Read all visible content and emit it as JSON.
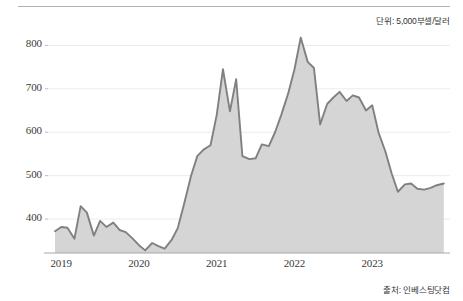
{
  "annotations": {
    "unit_note": "단위: 5,000부셀/달러",
    "source_note": "출처: 인베스팅닷컴"
  },
  "chart_data": {
    "type": "area",
    "title": "",
    "subtitle": "",
    "xlabel": "",
    "ylabel": "",
    "unit": "5,000부셀/달러",
    "source": "인베스팅닷컴",
    "grid": true,
    "legend": false,
    "xlim": [
      2018.83,
      2024.0
    ],
    "ylim": [
      322,
      840
    ],
    "ytick_labels": [
      "400",
      "500",
      "600",
      "700",
      "800"
    ],
    "ytick_values": [
      400,
      500,
      600,
      700,
      800
    ],
    "xtick_labels": [
      "2019",
      "2020",
      "2021",
      "2022",
      "2023"
    ],
    "xtick_values": [
      2019,
      2020,
      2021,
      2022,
      2023
    ],
    "line_color": "#808080",
    "fill_color": "#d5d5d5",
    "grid_color": "#ebebeb",
    "axis_color": "#a8a8a8",
    "series": [
      {
        "name": "대두 선물가격",
        "x": [
          2018.92,
          2019.0,
          2019.08,
          2019.17,
          2019.25,
          2019.33,
          2019.42,
          2019.5,
          2019.58,
          2019.67,
          2019.75,
          2019.83,
          2019.92,
          2020.0,
          2020.08,
          2020.17,
          2020.25,
          2020.33,
          2020.42,
          2020.5,
          2020.58,
          2020.67,
          2020.75,
          2020.83,
          2020.92,
          2021.0,
          2021.08,
          2021.17,
          2021.25,
          2021.33,
          2021.42,
          2021.5,
          2021.58,
          2021.67,
          2021.75,
          2021.83,
          2021.92,
          2022.0,
          2022.08,
          2022.17,
          2022.25,
          2022.33,
          2022.42,
          2022.5,
          2022.58,
          2022.67,
          2022.75,
          2022.83,
          2022.92,
          2023.0,
          2023.08,
          2023.17,
          2023.25,
          2023.33,
          2023.42,
          2023.5,
          2023.58,
          2023.67,
          2023.75,
          2023.83,
          2023.92
        ],
        "values": [
          372,
          382,
          380,
          355,
          430,
          415,
          362,
          396,
          382,
          392,
          375,
          370,
          355,
          340,
          328,
          345,
          338,
          332,
          352,
          380,
          435,
          500,
          545,
          560,
          570,
          640,
          745,
          648,
          722,
          545,
          538,
          540,
          572,
          568,
          600,
          640,
          690,
          745,
          818,
          762,
          748,
          618,
          665,
          680,
          693,
          672,
          685,
          680,
          650,
          662,
          600,
          555,
          505,
          463,
          480,
          482,
          470,
          468,
          472,
          478,
          482
        ]
      }
    ]
  }
}
